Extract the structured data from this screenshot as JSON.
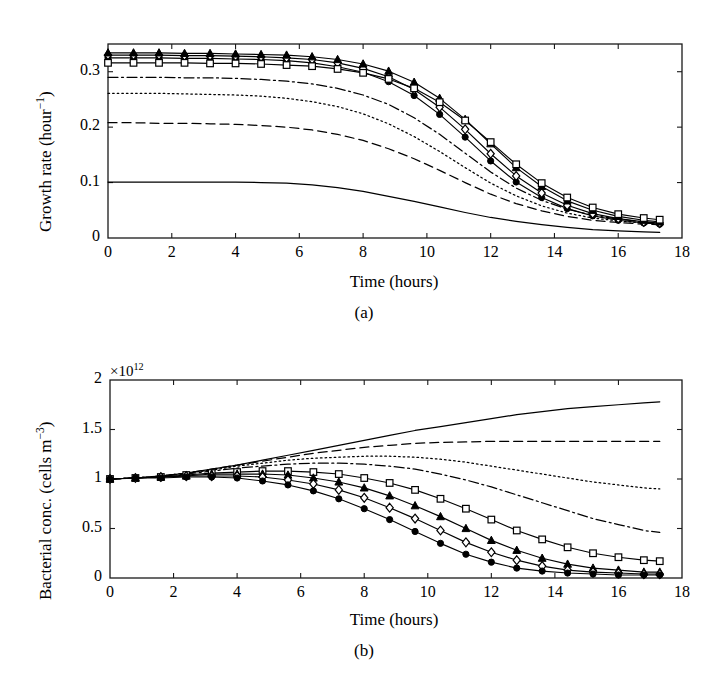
{
  "figure": {
    "panel_a_caption": "(a)",
    "panel_b_caption": "(b)",
    "xlabel": "Time (hours)"
  },
  "chart_data": [
    {
      "type": "line",
      "panel": "(a)",
      "title": "",
      "xlabel": "Time (hours)",
      "ylabel": "Growth rate (hour−1)",
      "ylabel_base": "Growth rate (hour",
      "ylabel_exp": "−1",
      "ylabel_tail": ")",
      "xlim": [
        0,
        18
      ],
      "ylim": [
        0,
        0.35
      ],
      "xticks": [
        0,
        2,
        4,
        6,
        8,
        10,
        12,
        14,
        16,
        18
      ],
      "xticklabels": [
        "0",
        "2",
        "4",
        "6",
        "8",
        "10",
        "12",
        "14",
        "16",
        "18"
      ],
      "yticks": [
        0,
        0.1,
        0.2,
        0.3
      ],
      "yticklabels": [
        "0",
        "0.1",
        "0.2",
        "0.3"
      ],
      "grid": false,
      "legend": "none",
      "x": [
        0,
        0.8,
        1.6,
        2.4,
        3.2,
        4,
        4.8,
        5.6,
        6.4,
        7.2,
        8,
        8.8,
        9.6,
        10.4,
        11.2,
        12,
        12.8,
        13.6,
        14.4,
        15.2,
        16,
        16.8,
        17.3
      ],
      "series": [
        {
          "name": "solid-line",
          "style": "solid",
          "marker": "none",
          "values": [
            0.101,
            0.101,
            0.101,
            0.101,
            0.101,
            0.101,
            0.1,
            0.099,
            0.096,
            0.091,
            0.084,
            0.075,
            0.066,
            0.056,
            0.046,
            0.037,
            0.03,
            0.024,
            0.019,
            0.015,
            0.013,
            0.011,
            0.01
          ]
        },
        {
          "name": "dashed-line",
          "style": "dashed",
          "marker": "none",
          "values": [
            0.208,
            0.208,
            0.207,
            0.207,
            0.206,
            0.205,
            0.203,
            0.2,
            0.195,
            0.187,
            0.176,
            0.161,
            0.143,
            0.122,
            0.1,
            0.079,
            0.062,
            0.049,
            0.039,
            0.032,
            0.028,
            0.025,
            0.024
          ]
        },
        {
          "name": "dotted-line",
          "style": "dotted",
          "marker": "none",
          "values": [
            0.261,
            0.261,
            0.261,
            0.26,
            0.259,
            0.258,
            0.256,
            0.252,
            0.246,
            0.237,
            0.224,
            0.206,
            0.183,
            0.156,
            0.127,
            0.099,
            0.076,
            0.058,
            0.045,
            0.036,
            0.031,
            0.027,
            0.026
          ]
        },
        {
          "name": "dash-dot-line",
          "style": "dashdot",
          "marker": "none",
          "values": [
            0.29,
            0.29,
            0.29,
            0.289,
            0.289,
            0.288,
            0.286,
            0.283,
            0.278,
            0.27,
            0.258,
            0.241,
            0.217,
            0.187,
            0.153,
            0.119,
            0.09,
            0.068,
            0.052,
            0.041,
            0.034,
            0.029,
            0.027
          ]
        },
        {
          "name": "circle-marker",
          "style": "solid",
          "marker": "filled-circle",
          "values": [
            0.325,
            0.325,
            0.325,
            0.324,
            0.324,
            0.323,
            0.322,
            0.32,
            0.316,
            0.309,
            0.299,
            0.282,
            0.257,
            0.223,
            0.182,
            0.139,
            0.101,
            0.073,
            0.053,
            0.04,
            0.032,
            0.027,
            0.025
          ]
        },
        {
          "name": "diamond-marker",
          "style": "solid",
          "marker": "open-diamond",
          "values": [
            0.33,
            0.33,
            0.33,
            0.329,
            0.329,
            0.328,
            0.327,
            0.325,
            0.322,
            0.316,
            0.306,
            0.291,
            0.268,
            0.236,
            0.196,
            0.152,
            0.112,
            0.081,
            0.059,
            0.044,
            0.035,
            0.029,
            0.027
          ]
        },
        {
          "name": "triangle-marker",
          "style": "solid",
          "marker": "filled-triangle",
          "values": [
            0.334,
            0.334,
            0.334,
            0.333,
            0.333,
            0.332,
            0.331,
            0.33,
            0.327,
            0.322,
            0.314,
            0.301,
            0.281,
            0.252,
            0.214,
            0.17,
            0.127,
            0.093,
            0.067,
            0.05,
            0.039,
            0.032,
            0.029
          ]
        },
        {
          "name": "square-marker",
          "style": "solid",
          "marker": "open-square",
          "values": [
            0.316,
            0.316,
            0.316,
            0.316,
            0.315,
            0.315,
            0.314,
            0.312,
            0.31,
            0.305,
            0.298,
            0.287,
            0.27,
            0.245,
            0.212,
            0.173,
            0.133,
            0.099,
            0.073,
            0.055,
            0.043,
            0.036,
            0.033
          ]
        }
      ]
    },
    {
      "type": "line",
      "panel": "(b)",
      "title": "",
      "xlabel": "Time (hours)",
      "ylabel": "Bacterial conc. (cells m−3)",
      "ylabel_base": "Bacterial conc. (cells m",
      "ylabel_exp": "−3",
      "ylabel_tail": ")",
      "y_exponent_label": "×10",
      "y_exponent_sup": "12",
      "xlim": [
        0,
        18
      ],
      "ylim": [
        0,
        2
      ],
      "xticks": [
        0,
        2,
        4,
        6,
        8,
        10,
        12,
        14,
        16,
        18
      ],
      "xticklabels": [
        "0",
        "2",
        "4",
        "6",
        "8",
        "10",
        "12",
        "14",
        "16",
        "18"
      ],
      "yticks": [
        0,
        0.5,
        1,
        1.5,
        2
      ],
      "yticklabels": [
        "0",
        "0.5",
        "1",
        "1.5",
        "2"
      ],
      "grid": false,
      "legend": "none",
      "x": [
        0,
        0.8,
        1.6,
        2.4,
        3.2,
        4,
        4.8,
        5.6,
        6.4,
        7.2,
        8,
        8.8,
        9.6,
        10.4,
        11.2,
        12,
        12.8,
        13.6,
        14.4,
        15.2,
        16,
        16.8,
        17.3
      ],
      "series": [
        {
          "name": "solid-line",
          "style": "solid",
          "marker": "none",
          "values": [
            1.0,
            1.01,
            1.03,
            1.06,
            1.1,
            1.14,
            1.19,
            1.24,
            1.29,
            1.34,
            1.39,
            1.44,
            1.49,
            1.53,
            1.57,
            1.61,
            1.65,
            1.68,
            1.71,
            1.73,
            1.75,
            1.77,
            1.78
          ]
        },
        {
          "name": "dashed-line",
          "style": "dashed",
          "marker": "none",
          "values": [
            1.0,
            1.01,
            1.03,
            1.06,
            1.1,
            1.14,
            1.18,
            1.22,
            1.26,
            1.29,
            1.32,
            1.34,
            1.36,
            1.37,
            1.375,
            1.38,
            1.38,
            1.38,
            1.38,
            1.38,
            1.38,
            1.38,
            1.38
          ]
        },
        {
          "name": "dotted-line",
          "style": "dotted",
          "marker": "none",
          "values": [
            1.0,
            1.01,
            1.03,
            1.06,
            1.09,
            1.13,
            1.16,
            1.19,
            1.21,
            1.22,
            1.23,
            1.23,
            1.22,
            1.2,
            1.17,
            1.13,
            1.09,
            1.05,
            1.01,
            0.97,
            0.94,
            0.91,
            0.9
          ]
        },
        {
          "name": "dash-dot-line",
          "style": "dashdot",
          "marker": "none",
          "values": [
            1.0,
            1.01,
            1.03,
            1.05,
            1.08,
            1.11,
            1.13,
            1.15,
            1.16,
            1.16,
            1.15,
            1.13,
            1.1,
            1.05,
            0.99,
            0.92,
            0.84,
            0.76,
            0.68,
            0.6,
            0.54,
            0.48,
            0.46
          ]
        },
        {
          "name": "square-marker",
          "style": "solid",
          "marker": "open-square",
          "values": [
            1.0,
            1.01,
            1.02,
            1.04,
            1.06,
            1.07,
            1.08,
            1.08,
            1.07,
            1.05,
            1.01,
            0.96,
            0.89,
            0.8,
            0.7,
            0.59,
            0.48,
            0.39,
            0.31,
            0.25,
            0.21,
            0.18,
            0.17
          ]
        },
        {
          "name": "triangle-marker",
          "style": "solid",
          "marker": "filled-triangle",
          "values": [
            1.0,
            1.01,
            1.02,
            1.03,
            1.05,
            1.05,
            1.05,
            1.04,
            1.01,
            0.97,
            0.91,
            0.83,
            0.73,
            0.62,
            0.5,
            0.38,
            0.28,
            0.2,
            0.14,
            0.1,
            0.08,
            0.06,
            0.06
          ]
        },
        {
          "name": "diamond-marker",
          "style": "solid",
          "marker": "open-diamond",
          "values": [
            1.0,
            1.01,
            1.02,
            1.03,
            1.03,
            1.03,
            1.02,
            0.99,
            0.95,
            0.89,
            0.81,
            0.71,
            0.6,
            0.48,
            0.36,
            0.26,
            0.18,
            0.12,
            0.08,
            0.06,
            0.05,
            0.04,
            0.04
          ]
        },
        {
          "name": "circle-marker",
          "style": "solid",
          "marker": "filled-circle",
          "values": [
            1.0,
            1.01,
            1.01,
            1.02,
            1.02,
            1.01,
            0.98,
            0.94,
            0.88,
            0.8,
            0.7,
            0.59,
            0.47,
            0.35,
            0.24,
            0.16,
            0.1,
            0.07,
            0.05,
            0.04,
            0.03,
            0.03,
            0.03
          ]
        }
      ]
    }
  ]
}
